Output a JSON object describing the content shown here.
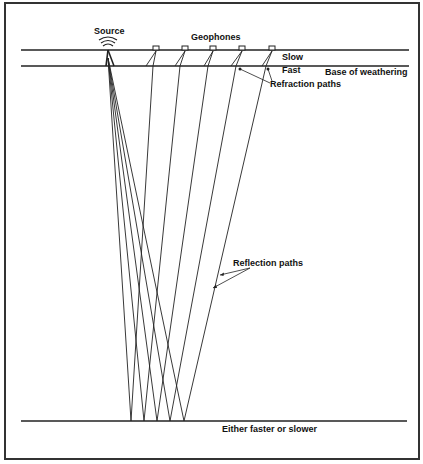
{
  "labels": {
    "source": "Source",
    "geophones": "Geophones",
    "slow": "Slow",
    "fast": "Fast",
    "base_of_weathering": "Base of weathering",
    "refraction_paths": "Refraction paths",
    "reflection_paths": "Reflection paths",
    "reflector": "Either faster or slower"
  },
  "icons": {
    "source": "source-wave-icon",
    "geophone": "geophone-icon"
  },
  "colors": {
    "line": "#222222",
    "background": "#ffffff"
  }
}
